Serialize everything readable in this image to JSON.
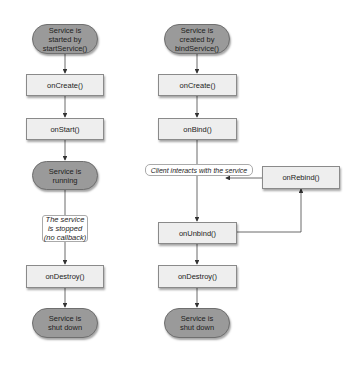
{
  "diagram": {
    "left_column": {
      "start": "Service is started by startService()",
      "start_lines": [
        "Service is",
        "started by",
        "startService()"
      ],
      "on_create": "onCreate()",
      "on_start": "onStart()",
      "running_lines": [
        "Service is",
        "running"
      ],
      "stopped_note_lines": [
        "The service",
        "is stopped",
        "(no callback)"
      ],
      "on_destroy": "onDestroy()",
      "shutdown_lines": [
        "Service is",
        "shut down"
      ]
    },
    "right_column": {
      "start_lines": [
        "Service is",
        "created by",
        "bindService()"
      ],
      "on_create": "onCreate()",
      "on_bind": "onBind()",
      "client_label": "Client interacts with the service",
      "on_rebind": "onRebind()",
      "on_unbind": "onUnbind()",
      "on_destroy": "onDestroy()",
      "shutdown_lines": [
        "Service is",
        "shut down"
      ]
    },
    "colors": {
      "pill_fill": "#9a9a9a",
      "box_fill": "#eeeeee",
      "line": "#333333"
    }
  }
}
